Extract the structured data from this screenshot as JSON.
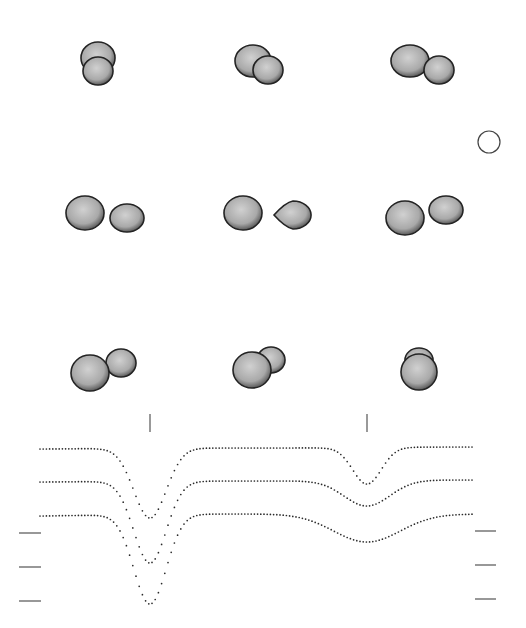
{
  "figure": {
    "background": "#ffffff",
    "ink_color": "#2a2a2a",
    "star_fill": "#cfcfcf",
    "star_rim": "#1e1e1e"
  },
  "scale_marker": {
    "name": "reference-circle",
    "cx": 489,
    "cy": 142,
    "r": 11
  },
  "panels": [
    {
      "id": 1,
      "row": 0,
      "col": 0,
      "primary": {
        "cx": 98,
        "cy": 58,
        "rx": 17,
        "ry": 16
      },
      "secondary": {
        "cx": 98,
        "cy": 71,
        "rx": 15,
        "ry": 14
      },
      "secondary_in_front": true
    },
    {
      "id": 2,
      "row": 0,
      "col": 1,
      "primary": {
        "cx": 253,
        "cy": 61,
        "rx": 18,
        "ry": 16
      },
      "secondary": {
        "cx": 268,
        "cy": 70,
        "rx": 15,
        "ry": 14
      },
      "secondary_in_front": true
    },
    {
      "id": 3,
      "row": 0,
      "col": 2,
      "primary": {
        "cx": 410,
        "cy": 61,
        "rx": 19,
        "ry": 16
      },
      "secondary": {
        "cx": 439,
        "cy": 70,
        "rx": 15,
        "ry": 14
      },
      "secondary_in_front": true
    },
    {
      "id": 4,
      "row": 1,
      "col": 0,
      "primary": {
        "cx": 85,
        "cy": 213,
        "rx": 19,
        "ry": 17
      },
      "secondary": {
        "cx": 127,
        "cy": 218,
        "rx": 17,
        "ry": 14
      },
      "secondary_in_front": false
    },
    {
      "id": 5,
      "row": 1,
      "col": 1,
      "primary": {
        "cx": 243,
        "cy": 213,
        "rx": 19,
        "ry": 17
      },
      "secondary": {
        "cx": 293,
        "cy": 215,
        "rx": 19,
        "ry": 14
      },
      "secondary_in_front": false,
      "teardrop_secondary": true
    },
    {
      "id": 6,
      "row": 1,
      "col": 2,
      "primary": {
        "cx": 405,
        "cy": 218,
        "rx": 19,
        "ry": 17
      },
      "secondary": {
        "cx": 446,
        "cy": 210,
        "rx": 17,
        "ry": 14
      },
      "secondary_in_front": false
    },
    {
      "id": 7,
      "row": 2,
      "col": 0,
      "primary": {
        "cx": 90,
        "cy": 373,
        "rx": 19,
        "ry": 18
      },
      "secondary": {
        "cx": 121,
        "cy": 363,
        "rx": 15,
        "ry": 14
      },
      "secondary_in_front": false
    },
    {
      "id": 8,
      "row": 2,
      "col": 1,
      "primary": {
        "cx": 252,
        "cy": 370,
        "rx": 19,
        "ry": 18
      },
      "secondary": {
        "cx": 271,
        "cy": 360,
        "rx": 14,
        "ry": 13
      },
      "secondary_in_front": false
    },
    {
      "id": 9,
      "row": 2,
      "col": 2,
      "primary": {
        "cx": 419,
        "cy": 372,
        "rx": 18,
        "ry": 18
      },
      "secondary": {
        "cx": 419,
        "cy": 360,
        "rx": 14,
        "ry": 12
      },
      "secondary_in_front": false
    }
  ],
  "eclipse_markers": [
    {
      "name": "primary-eclipse-marker",
      "x": 150,
      "y1": 414,
      "y2": 432
    },
    {
      "name": "secondary-eclipse-marker",
      "x": 367,
      "y1": 414,
      "y2": 432
    }
  ],
  "left_ticks": [
    {
      "y": 533
    },
    {
      "y": 567
    },
    {
      "y": 601
    }
  ],
  "right_ticks": [
    {
      "y": 531
    },
    {
      "y": 565
    },
    {
      "y": 599
    }
  ],
  "chart_data": {
    "type": "scatter",
    "title": "",
    "xlabel": "",
    "ylabel": "",
    "grid": false,
    "legend": "none",
    "x_range_px": [
      40,
      472
    ],
    "series": [
      {
        "name": "curve-1",
        "start_y": 449,
        "primary_min_y": 518,
        "max_y": 448,
        "max_x": 265,
        "secondary_min_y": 484,
        "end_y": 447,
        "primary_width": 34,
        "secondary_width": 30
      },
      {
        "name": "curve-2",
        "start_y": 482,
        "primary_min_y": 563,
        "max_y": 481,
        "max_x": 260,
        "secondary_min_y": 506,
        "end_y": 480,
        "primary_width": 34,
        "secondary_width": 48
      },
      {
        "name": "curve-3",
        "start_y": 516,
        "primary_min_y": 604,
        "max_y": 514,
        "max_x": 248,
        "secondary_min_y": 542,
        "end_y": 514,
        "primary_width": 34,
        "secondary_width": 70
      }
    ],
    "primary_eclipse_x": 150,
    "secondary_eclipse_x": 367
  }
}
